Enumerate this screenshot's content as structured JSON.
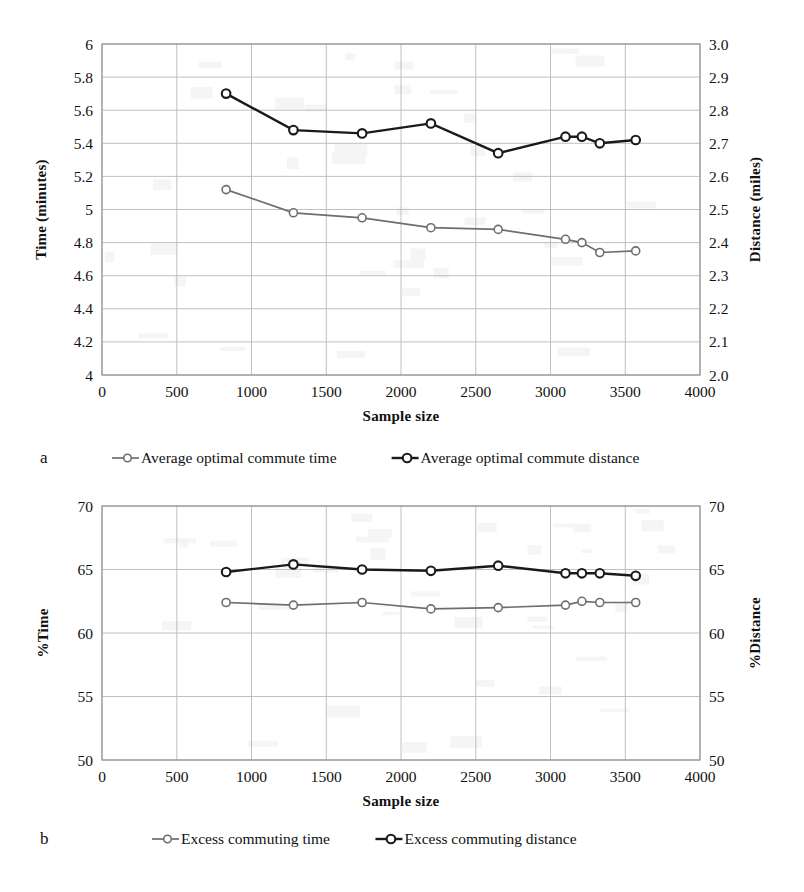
{
  "figure": {
    "panels": [
      {
        "letter": "a",
        "xlabel": "Sample size",
        "ylabel_left": "Time (minutes)",
        "ylabel_right": "Distance (miles)",
        "legend": [
          {
            "label": "Average optimal commute time",
            "style": "light"
          },
          {
            "label": "Average optimal commute distance",
            "style": "dark"
          }
        ]
      },
      {
        "letter": "b",
        "xlabel": "Sample size",
        "ylabel_left": "%Time",
        "ylabel_right": "%Distance",
        "legend": [
          {
            "label": "Excess commuting time",
            "style": "light"
          },
          {
            "label": "Excess commuting distance",
            "style": "dark"
          }
        ]
      }
    ]
  },
  "chart_data": [
    {
      "type": "line",
      "panel": "a",
      "title": "",
      "xlabel": "Sample size",
      "ylabel": "Time (minutes)",
      "ylabel_secondary": "Distance (miles)",
      "xlim": [
        0,
        4000
      ],
      "xticks": [
        0,
        500,
        1000,
        1500,
        2000,
        2500,
        3000,
        3500,
        4000
      ],
      "xtick_labels": [
        "0",
        "500",
        "1000",
        "1500",
        "2000",
        "2500",
        "3000",
        "3500",
        "4000"
      ],
      "ylim": [
        4,
        6
      ],
      "yticks": [
        4,
        4.2,
        4.4,
        4.6,
        4.8,
        5,
        5.2,
        5.4,
        5.6,
        5.8,
        6
      ],
      "ytick_labels": [
        "4",
        "4.2",
        "4.4",
        "4.6",
        "4.8",
        "5",
        "5.2",
        "5.4",
        "5.6",
        "5.8",
        "6"
      ],
      "ylim_secondary": [
        2.0,
        3.0
      ],
      "yticks_secondary": [
        2.0,
        2.1,
        2.2,
        2.3,
        2.4,
        2.5,
        2.6,
        2.7,
        2.8,
        2.9,
        3.0
      ],
      "ytick_labels_secondary": [
        "2.0",
        "2.1",
        "2.2",
        "2.3",
        "2.4",
        "2.5",
        "2.6",
        "2.7",
        "2.8",
        "2.9",
        "3.0"
      ],
      "grid": true,
      "legend_position": "below",
      "x": [
        830,
        1280,
        1740,
        2200,
        2650,
        3100,
        3210,
        3330,
        3570
      ],
      "series": [
        {
          "name": "Average optimal commute time",
          "axis": "left",
          "style": "light",
          "values": [
            5.12,
            4.98,
            4.95,
            4.89,
            4.88,
            4.82,
            4.8,
            4.74,
            4.75
          ]
        },
        {
          "name": "Average optimal commute distance",
          "axis": "right",
          "style": "dark",
          "values": [
            2.85,
            2.74,
            2.73,
            2.76,
            2.67,
            2.72,
            2.72,
            2.7,
            2.71
          ]
        }
      ]
    },
    {
      "type": "line",
      "panel": "b",
      "title": "",
      "xlabel": "Sample size",
      "ylabel": "%Time",
      "ylabel_secondary": "%Distance",
      "xlim": [
        0,
        4000
      ],
      "xticks": [
        0,
        500,
        1000,
        1500,
        2000,
        2500,
        3000,
        3500,
        4000
      ],
      "xtick_labels": [
        "0",
        "500",
        "1000",
        "1500",
        "2000",
        "2500",
        "3000",
        "3500",
        "4000"
      ],
      "ylim": [
        50,
        70
      ],
      "yticks": [
        50,
        55,
        60,
        65,
        70
      ],
      "ytick_labels": [
        "50",
        "55",
        "60",
        "65",
        "70"
      ],
      "ylim_secondary": [
        50,
        70
      ],
      "yticks_secondary": [
        50,
        55,
        60,
        65,
        70
      ],
      "ytick_labels_secondary": [
        "50",
        "55",
        "60",
        "65",
        "70"
      ],
      "grid": true,
      "legend_position": "below",
      "x": [
        830,
        1280,
        1740,
        2200,
        2650,
        3100,
        3210,
        3330,
        3570
      ],
      "series": [
        {
          "name": "Excess commuting time",
          "axis": "left",
          "style": "light",
          "values": [
            62.4,
            62.2,
            62.4,
            61.9,
            62.0,
            62.2,
            62.5,
            62.4,
            62.4
          ]
        },
        {
          "name": "Excess commuting distance",
          "axis": "right",
          "style": "dark",
          "values": [
            64.8,
            65.4,
            65.0,
            64.9,
            65.3,
            64.7,
            64.7,
            64.7,
            64.5
          ]
        }
      ]
    }
  ]
}
